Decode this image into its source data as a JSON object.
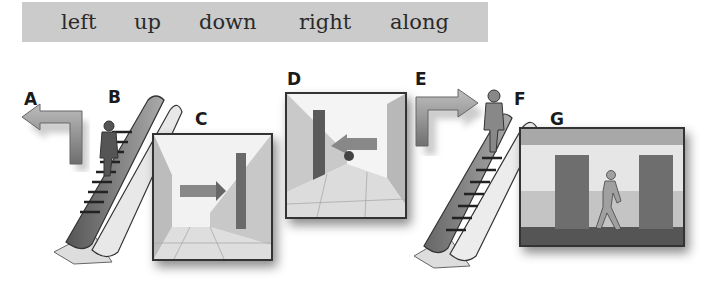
{
  "word_bank": {
    "words": [
      "left",
      "up",
      "down",
      "right",
      "along"
    ]
  },
  "labels": [
    "A",
    "B",
    "C",
    "D",
    "E",
    "F",
    "G"
  ],
  "illustrations": {
    "A": "arrow-turn-left-icon",
    "B": "escalator-up-with-person",
    "C": "corridor-arrow-right-turn",
    "D": "corridor-arrow-left-turn",
    "E": "arrow-turn-right-icon",
    "F": "escalator-down-with-person",
    "G": "person-walking-along-corridor"
  },
  "colors": {
    "word_bank_bg": "#cbcbcb",
    "text": "#2a2a2a",
    "frame_border": "#333333"
  }
}
